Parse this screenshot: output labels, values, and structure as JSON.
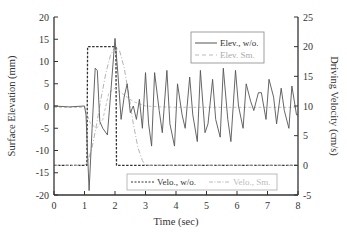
{
  "chart_data": {
    "type": "line",
    "title": "",
    "xlabel": "Time (sec)",
    "ylabel_left": "Surface Elevation (mm)",
    "ylabel_right": "Driving Velocity (cm/s)",
    "xlim": [
      0,
      8
    ],
    "ylim_left": [
      -20,
      20
    ],
    "ylim_right": [
      -5,
      25
    ],
    "x_ticks": [
      "0",
      "1",
      "2",
      "3",
      "4",
      "5",
      "6",
      "7",
      "8"
    ],
    "y_ticks_left": [
      "20",
      "15",
      "10",
      "5",
      "0",
      "-5",
      "-10",
      "-15",
      "-20"
    ],
    "y_ticks_right": [
      "25",
      "20",
      "15",
      "10",
      "5",
      "0",
      "-5"
    ],
    "grid": false,
    "legends": [
      {
        "position": "upper-right",
        "entries": [
          "Elev., w/o.",
          "Elev. Sm."
        ]
      },
      {
        "position": "lower-right",
        "entries": [
          "Velo., w/o.",
          "Velo., Sm."
        ]
      }
    ],
    "series": [
      {
        "name": "Elev., w/o.",
        "axis": "left",
        "style": "solid",
        "color": "#555555",
        "x": [
          0,
          0.5,
          1.0,
          1.05,
          1.15,
          1.25,
          1.35,
          1.42,
          1.5,
          1.6,
          1.75,
          1.85,
          2.0,
          2.1,
          2.2,
          2.3,
          2.4,
          2.5,
          2.6,
          2.7,
          2.8,
          2.9,
          3.0,
          3.1,
          3.2,
          3.3,
          3.45,
          3.55,
          3.7,
          3.8,
          3.95,
          4.05,
          4.2,
          4.3,
          4.45,
          4.55,
          4.7,
          4.8,
          4.95,
          5.05,
          5.2,
          5.3,
          5.45,
          5.55,
          5.7,
          5.8,
          5.95,
          6.05,
          6.2,
          6.3,
          6.45,
          6.55,
          6.7,
          6.8,
          6.95,
          7.05,
          7.2,
          7.3,
          7.45,
          7.55,
          7.7,
          7.8,
          7.95,
          8.0
        ],
        "values": [
          0,
          -0.2,
          0,
          -2,
          -19,
          -5,
          8.5,
          8,
          -3.5,
          -5,
          -6.5,
          2,
          15.2,
          7,
          -3,
          2,
          5,
          -1.5,
          0,
          -3,
          1.5,
          -5,
          7.5,
          -4,
          -9,
          7.5,
          -1,
          -6,
          8,
          -4,
          -9,
          5,
          -2,
          -5,
          6.5,
          -2,
          -8,
          8,
          -6,
          -4,
          6,
          -3,
          -7,
          8.5,
          -3,
          -8,
          8,
          0,
          -5,
          5,
          1,
          -1,
          3,
          3,
          -3,
          6,
          2,
          -4,
          4,
          -1,
          -5,
          4.5,
          -2,
          -2
        ]
      },
      {
        "name": "Elev. Sm.",
        "axis": "left",
        "style": "dashed",
        "color": "#bbbbbb",
        "x": [
          0,
          1.0,
          1.2,
          1.4,
          1.6,
          1.8,
          2.0,
          2.2,
          2.4,
          2.6,
          2.8,
          3.0,
          3.5,
          4.0,
          5.0,
          6.0,
          7.0,
          8.0
        ],
        "values": [
          -0.3,
          -0.3,
          -4,
          -5,
          -3,
          3,
          4,
          3,
          2,
          1,
          0.5,
          0,
          -0.2,
          -0.3,
          -0.3,
          -0.3,
          -0.3,
          -0.3
        ]
      },
      {
        "name": "Velo., w/o.",
        "axis": "right",
        "style": "dashed",
        "color": "#333333",
        "x": [
          0,
          1.0,
          1.08,
          1.1,
          2.0,
          2.03,
          2.05,
          8.0
        ],
        "values": [
          0,
          0,
          0,
          20,
          20,
          20,
          0,
          0
        ]
      },
      {
        "name": "Velo., Sm.",
        "axis": "right",
        "style": "dashdot",
        "color": "#aaaaaa",
        "x": [
          0,
          0.5,
          1.0,
          1.1,
          1.25,
          1.4,
          1.55,
          1.7,
          1.85,
          2.0,
          2.15,
          2.3,
          2.45,
          2.6,
          2.75,
          2.9,
          3.0,
          3.5,
          4.0,
          5.0,
          6.0,
          7.0,
          8.0
        ],
        "values": [
          0,
          0,
          0,
          0.5,
          3,
          7,
          11.5,
          15.5,
          18.5,
          20,
          19.3,
          16.5,
          12,
          7,
          3,
          0.8,
          0,
          0,
          0,
          0,
          0,
          0,
          0
        ]
      }
    ]
  }
}
